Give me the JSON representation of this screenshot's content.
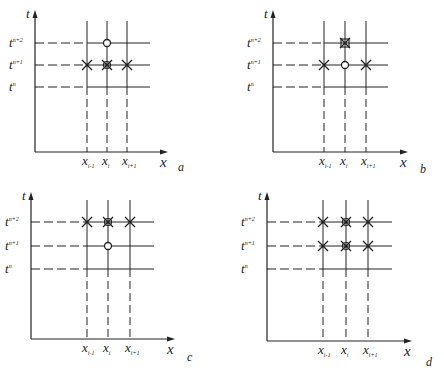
{
  "figure": {
    "panels": [
      {
        "id": "a",
        "caption": "a",
        "origin": [
          35,
          152
        ],
        "t_top": 10,
        "x_end": 168,
        "rows_y": [
          87,
          65,
          43
        ],
        "cols_x": [
          87,
          107,
          127
        ],
        "grid_end": 150,
        "caption_pos": [
          178,
          171
        ],
        "markers": [
          {
            "col": 0,
            "row": 1,
            "type": "cross"
          },
          {
            "col": 1,
            "row": 1,
            "type": "cross-circle"
          },
          {
            "col": 2,
            "row": 1,
            "type": "cross"
          },
          {
            "col": 1,
            "row": 2,
            "type": "circle"
          }
        ]
      },
      {
        "id": "b",
        "caption": "b",
        "origin": [
          273,
          152
        ],
        "t_top": 10,
        "x_end": 408,
        "rows_y": [
          87,
          65,
          43
        ],
        "cols_x": [
          324,
          345,
          366
        ],
        "grid_end": 388,
        "caption_pos": [
          420,
          173
        ],
        "markers": [
          {
            "col": 0,
            "row": 1,
            "type": "cross"
          },
          {
            "col": 1,
            "row": 1,
            "type": "circle"
          },
          {
            "col": 2,
            "row": 1,
            "type": "cross"
          },
          {
            "col": 1,
            "row": 2,
            "type": "cross-box"
          }
        ]
      },
      {
        "id": "c",
        "caption": "c",
        "origin": [
          31,
          339
        ],
        "t_top": 192,
        "x_end": 175,
        "rows_y": [
          269,
          246,
          222
        ],
        "cols_x": [
          87,
          108,
          130
        ],
        "grid_end": 154,
        "caption_pos": [
          187,
          361
        ],
        "markers": [
          {
            "col": 0,
            "row": 2,
            "type": "cross"
          },
          {
            "col": 1,
            "row": 2,
            "type": "cross-circle"
          },
          {
            "col": 2,
            "row": 2,
            "type": "cross"
          },
          {
            "col": 1,
            "row": 1,
            "type": "circle"
          }
        ]
      },
      {
        "id": "d",
        "caption": "d",
        "origin": [
          267,
          341
        ],
        "t_top": 192,
        "x_end": 412,
        "rows_y": [
          269,
          246,
          222
        ],
        "cols_x": [
          323,
          346,
          368
        ],
        "grid_end": 392,
        "caption_pos": [
          426,
          366
        ],
        "markers": [
          {
            "col": 0,
            "row": 1,
            "type": "cross"
          },
          {
            "col": 1,
            "row": 1,
            "type": "cross-circle"
          },
          {
            "col": 2,
            "row": 1,
            "type": "cross"
          },
          {
            "col": 0,
            "row": 2,
            "type": "cross"
          },
          {
            "col": 1,
            "row": 2,
            "type": "cross-circle"
          },
          {
            "col": 2,
            "row": 2,
            "type": "cross"
          }
        ]
      }
    ],
    "labels": {
      "t_axis": "t",
      "x_axis": "x",
      "rows": [
        "t",
        "t",
        "t"
      ],
      "rows_sup": [
        "n",
        "n+1",
        "n+2"
      ],
      "cols": [
        "x",
        "x",
        "x"
      ],
      "cols_sub": [
        "i-1",
        "i",
        "i+1"
      ]
    },
    "colors": {
      "ink": "#222222",
      "background": "#ffffff"
    }
  }
}
